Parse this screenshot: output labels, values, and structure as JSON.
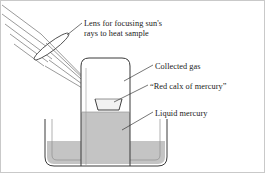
{
  "figure": {
    "border_color": "#c9c9c9",
    "background": "#ffffff"
  },
  "colors": {
    "ink": "#1a1a1a",
    "outline": "#3a3a3a",
    "ray": "#555555",
    "mercury_fill": "#c4c4c4",
    "mercury_stroke": "#9a9a9a",
    "gas_fill": "#ffffff",
    "calx_fill": "#f2f2f2",
    "lens_fill": "#ffffff",
    "leader": "#2b2b2b"
  },
  "labels": {
    "lens": {
      "line1": "Lens for focusing sun's",
      "line2": "rays to heat sample"
    },
    "collected_gas": "Collected gas",
    "red_calx": "“Red calx of mercury”",
    "liquid_mercury": "Liquid mercury"
  },
  "apparatus": {
    "sun_rays": {
      "name": "parallel sunlight rays",
      "count": 5,
      "direction": "upper-left to lower-right"
    },
    "lens": {
      "name": "convex lens",
      "tilt_degrees": -37
    },
    "converging_rays": {
      "name": "converging focused rays",
      "count": 5,
      "focus": "red calx sample dish"
    },
    "bell_jar": {
      "name": "inverted bell jar",
      "contents": "collected gas"
    },
    "calx_dish": {
      "name": "sample dish holding red calx of mercury"
    },
    "trough": {
      "name": "mercury trough",
      "contents": "liquid mercury"
    }
  }
}
